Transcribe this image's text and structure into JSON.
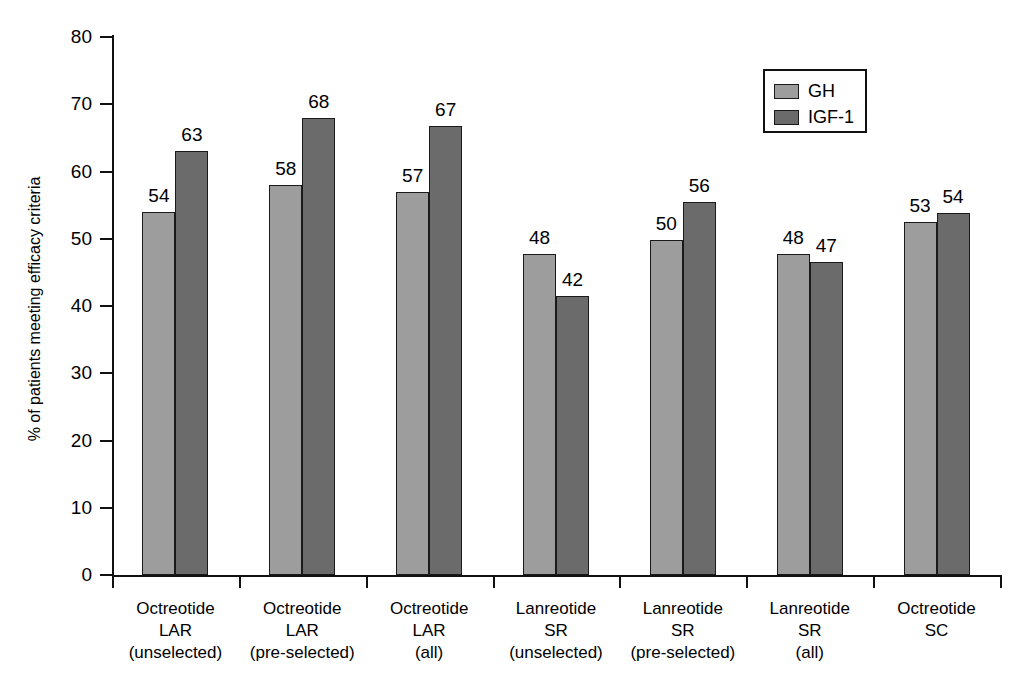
{
  "chart_data": {
    "type": "bar",
    "title": "",
    "xlabel": "",
    "ylabel": "% of patients meeting efficacy criteria",
    "ylim": [
      0,
      80
    ],
    "ytick_step": 10,
    "yticks": [
      "80",
      "70",
      "60",
      "50",
      "40",
      "30",
      "20",
      "10",
      "0"
    ],
    "grid": false,
    "legend_position": "top-right",
    "categories": [
      {
        "lines": [
          "Octreotide",
          "LAR",
          "(unselected)"
        ]
      },
      {
        "lines": [
          "Octreotide",
          "LAR",
          "(pre-selected)"
        ]
      },
      {
        "lines": [
          "Octreotide",
          "LAR",
          "(all)"
        ]
      },
      {
        "lines": [
          "Lanreotide",
          "SR",
          "(unselected)"
        ]
      },
      {
        "lines": [
          "Lanreotide",
          "SR",
          "(pre-selected)"
        ]
      },
      {
        "lines": [
          "Lanreotide",
          "SR",
          "(all)"
        ]
      },
      {
        "lines": [
          "Octreotide",
          "SC",
          ""
        ]
      }
    ],
    "series": [
      {
        "name": "GH",
        "color": "#9d9d9d",
        "values": [
          54,
          58,
          57,
          48,
          50,
          48,
          53
        ],
        "drawn_values": [
          54,
          58,
          57,
          47.8,
          49.8,
          47.8,
          52.5
        ],
        "labels": [
          "54",
          "58",
          "57",
          "48",
          "50",
          "48",
          "53"
        ]
      },
      {
        "name": "IGF-1",
        "color": "#6b6b6b",
        "values": [
          63,
          68,
          67,
          42,
          56,
          47,
          54
        ],
        "drawn_values": [
          63,
          68,
          66.8,
          41.5,
          55.5,
          46.5,
          53.8
        ],
        "labels": [
          "63",
          "68",
          "67",
          "42",
          "56",
          "47",
          "54"
        ]
      }
    ]
  },
  "legend": {
    "entries": [
      {
        "label": "GH",
        "color": "#9d9d9d"
      },
      {
        "label": "IGF-1",
        "color": "#6b6b6b"
      }
    ]
  }
}
